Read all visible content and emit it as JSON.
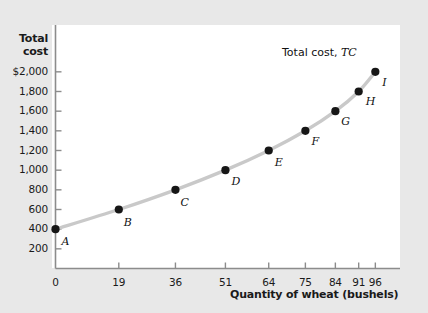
{
  "figure": {
    "background_color": "#e8e8e8",
    "panel_color": "#ffffff",
    "axis_color": "#8c8c8c",
    "curve_color": "#c9c9c9",
    "point_color": "#161616"
  },
  "axes": {
    "y_title_line1": "Total",
    "y_title_line2": "cost",
    "x_title": "Quantity of wheat (bushels)",
    "origin_label": "0"
  },
  "chart_data": {
    "type": "line",
    "title": "",
    "subtitle": "",
    "xlabel": "Quantity of wheat (bushels)",
    "ylabel": "Total cost",
    "grid": false,
    "legend_position": "inline-annotation",
    "series_annotation": "Total cost, TC",
    "series_annotation_plain": "Total cost,",
    "series_annotation_italic": "TC",
    "xlim": [
      0,
      101
    ],
    "ylim": [
      0,
      2100
    ],
    "xticks": [
      0,
      19,
      36,
      51,
      64,
      75,
      84,
      91,
      96
    ],
    "xticklabels": [
      "0",
      "19",
      "36",
      "51",
      "64",
      "75",
      "84",
      "91",
      "96"
    ],
    "yticks": [
      200,
      400,
      600,
      800,
      1000,
      1200,
      1400,
      1600,
      1800,
      2000
    ],
    "yticklabels": [
      "200",
      "400",
      "600",
      "800",
      "1,000",
      "1,200",
      "1,400",
      "1,600",
      "1,800",
      "$2,000"
    ],
    "series": [
      {
        "name": "Total cost, TC",
        "x": [
          0,
          19,
          36,
          51,
          64,
          75,
          84,
          91,
          96
        ],
        "values": [
          400,
          600,
          800,
          1000,
          1200,
          1400,
          1600,
          1800,
          2000
        ],
        "point_labels": [
          "A",
          "B",
          "C",
          "D",
          "E",
          "F",
          "G",
          "H",
          "I"
        ]
      }
    ]
  }
}
